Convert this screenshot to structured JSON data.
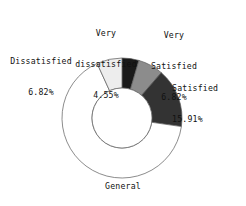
{
  "chart_data": {
    "type": "pie",
    "variant": "donut",
    "title": "",
    "subtitle": "",
    "xlabel": "",
    "ylabel": "",
    "grid": false,
    "legend": "none",
    "label_format": "name + percent",
    "start_angle_deg": 0,
    "direction": "clockwise",
    "categories": [
      "Very dissatisfied",
      "Very Satisfied",
      "Satisfied",
      "General",
      "Dissatisfied"
    ],
    "values": [
      4.55,
      6.82,
      15.91,
      65.91,
      6.82
    ],
    "value_unit": "%",
    "total": 100.0,
    "slices": [
      {
        "name": "Very dissatisfied",
        "value": 4.55,
        "value_text": "4.55%",
        "color": "#1a1a1a",
        "start_deg": 0.0,
        "end_deg": 16.38
      },
      {
        "name": "Very Satisfied",
        "value": 6.82,
        "value_text": "6.82%",
        "color": "#8c8c8c",
        "start_deg": 16.38,
        "end_deg": 40.93
      },
      {
        "name": "Satisfied",
        "value": 15.91,
        "value_text": "15.91%",
        "color": "#333333",
        "start_deg": 40.93,
        "end_deg": 98.21
      },
      {
        "name": "General",
        "value": 65.91,
        "value_text": "65.91%",
        "color": "#ffffff",
        "start_deg": 98.21,
        "end_deg": 335.49
      },
      {
        "name": "Dissatisfied",
        "value": 6.82,
        "value_text": "6.82%",
        "color": "#ededed",
        "start_deg": 335.49,
        "end_deg": 360.0
      }
    ]
  },
  "labels": {
    "very_dissatisfied": {
      "name_line1": "Very",
      "name_line2": "dissatisfied",
      "value": "4.55%"
    },
    "very_satisfied": {
      "name_line1": "Very",
      "name_line2": "Satisfied",
      "value": "6.82%"
    },
    "dissatisfied": {
      "name_line1": "Dissatisfied",
      "value": "6.82%"
    },
    "satisfied": {
      "name_line1": "Satisfied",
      "value": "15.91%"
    },
    "general": {
      "name_line1": "General",
      "value": "65.91%"
    }
  },
  "style": {
    "background": "#ffffff",
    "outline": "#5a5a5a",
    "text": "#111111"
  }
}
